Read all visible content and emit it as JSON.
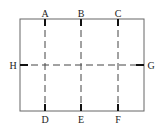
{
  "diagram": {
    "type": "section-cut-plan",
    "stroke_color": "#555555",
    "frame": {
      "x": 20,
      "y": 19,
      "width": 124,
      "height": 92
    },
    "cut_lines": [
      {
        "id": "AD",
        "orientation": "vertical",
        "top_label": "A",
        "bottom_label": "D",
        "x": 45
      },
      {
        "id": "BE",
        "orientation": "vertical",
        "top_label": "B",
        "bottom_label": "E",
        "x": 81
      },
      {
        "id": "CF",
        "orientation": "vertical",
        "top_label": "C",
        "bottom_label": "F",
        "x": 118
      },
      {
        "id": "HG",
        "orientation": "horizontal",
        "left_label": "H",
        "right_label": "G",
        "y": 65
      }
    ],
    "labels": {
      "A": "A",
      "B": "B",
      "C": "C",
      "D": "D",
      "E": "E",
      "F": "F",
      "G": "G",
      "H": "H"
    }
  }
}
